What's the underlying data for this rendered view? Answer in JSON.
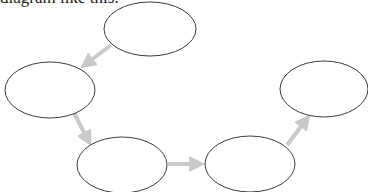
{
  "caption": "diagram like this:",
  "colors": {
    "ellipse_stroke": "#3a3a3a",
    "ellipse_fill": "#ffffff",
    "arrow": "#c9c9c9"
  },
  "nodes": [
    {
      "id": "node-1",
      "cx": 150,
      "cy": 29,
      "rx": 46,
      "ry": 27,
      "label": ""
    },
    {
      "id": "node-2",
      "cx": 50,
      "cy": 90,
      "rx": 45,
      "ry": 28,
      "label": ""
    },
    {
      "id": "node-3",
      "cx": 122,
      "cy": 165,
      "rx": 45,
      "ry": 28,
      "label": ""
    },
    {
      "id": "node-4",
      "cx": 250,
      "cy": 164,
      "rx": 45,
      "ry": 28,
      "label": ""
    },
    {
      "id": "node-5",
      "cx": 324,
      "cy": 89,
      "rx": 44,
      "ry": 28,
      "label": ""
    }
  ],
  "arrows": [
    {
      "id": "arrow-1-2",
      "from": "node-1",
      "to": "node-2",
      "x1": 111,
      "y1": 45,
      "x2": 86,
      "y2": 64
    },
    {
      "id": "arrow-2-3",
      "from": "node-2",
      "to": "node-3",
      "x1": 74,
      "y1": 113,
      "x2": 88,
      "y2": 140
    },
    {
      "id": "arrow-3-4",
      "from": "node-3",
      "to": "node-4",
      "x1": 168,
      "y1": 164,
      "x2": 198,
      "y2": 164
    },
    {
      "id": "arrow-4-5",
      "from": "node-4",
      "to": "node-5",
      "x1": 287,
      "y1": 145,
      "x2": 306,
      "y2": 120
    }
  ]
}
